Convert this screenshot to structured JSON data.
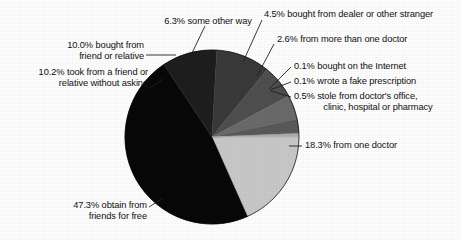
{
  "chart_data": {
    "type": "pie",
    "title": "",
    "subtitle": "",
    "xlabel": "",
    "ylabel": "",
    "legend_position": "none",
    "grid": false,
    "units": "percent",
    "total": 100,
    "categories": [
      "from one doctor",
      "obtain from friends for free",
      "took from a friend or relative without asking",
      "bought from friend or relative",
      "some other way",
      "bought from dealer or other stranger",
      "from more than one doctor",
      "bought on the Internet",
      "wrote a fake prescription",
      "stole from doctor's office, clinic, hospital or pharmacy"
    ],
    "values": [
      18.3,
      47.3,
      10.2,
      10.0,
      6.3,
      4.5,
      2.6,
      0.1,
      0.1,
      0.5
    ],
    "colors": [
      "#c9c9c9",
      "#080808",
      "#1e1e1e",
      "#3a3a3a",
      "#4f4f4f",
      "#6b6b6b",
      "#5a5a5a",
      "#8a8a8a",
      "#9a9a9a",
      "#b0b0b0"
    ],
    "slices": [
      {
        "label": "18.3% from one doctor",
        "value": 18.3,
        "color": "#c9c9c9"
      },
      {
        "label": "47.3% obtain from\nfriends for free",
        "value": 47.3,
        "color": "#080808"
      },
      {
        "label": "10.2% took from a friend or\nrelative without asking",
        "value": 10.2,
        "color": "#1e1e1e"
      },
      {
        "label": "10.0% bought from\nfriend or relative",
        "value": 10.0,
        "color": "#3a3a3a"
      },
      {
        "label": "6.3% some other way",
        "value": 6.3,
        "color": "#4f4f4f"
      },
      {
        "label": "4.5% bought from dealer or other stranger",
        "value": 4.5,
        "color": "#6b6b6b"
      },
      {
        "label": "2.6% from more than one doctor",
        "value": 2.6,
        "color": "#5a5a5a"
      },
      {
        "label": "0.1% bought on the Internet",
        "value": 0.1,
        "color": "#8a8a8a"
      },
      {
        "label": "0.1% wrote a fake prescription",
        "value": 0.1,
        "color": "#9a9a9a"
      },
      {
        "label": "0.5% stole from doctor's office,\nclinic, hospital or pharmacy",
        "value": 0.5,
        "color": "#b0b0b0"
      }
    ]
  },
  "labels": {
    "one_doctor": "18.3% from one doctor",
    "friends_free_l1": "47.3% obtain from",
    "friends_free_l2": "friends for free",
    "took_without_asking_l1": "10.2% took from a friend or",
    "took_without_asking_l2": "relative without asking",
    "bought_friend_l1": "10.0% bought from",
    "bought_friend_l2": "friend or relative",
    "some_other_way": "6.3% some other way",
    "dealer": "4.5% bought from dealer or other stranger",
    "more_than_one_doctor": "2.6% from more than one doctor",
    "internet": "0.1% bought on the Internet",
    "fake_prescription": "0.1% wrote a fake prescription",
    "stole_l1": "0.5% stole from doctor's office,",
    "stole_l2": "clinic, hospital or pharmacy"
  },
  "geometry": {
    "center_x": 212,
    "center_y": 137,
    "radius": 87
  }
}
